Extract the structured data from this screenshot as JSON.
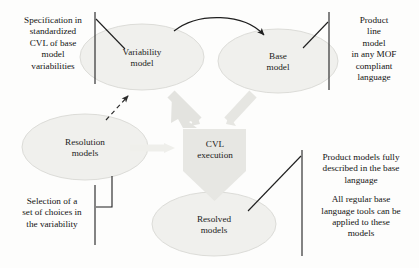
{
  "diagram": {
    "palette": {
      "ellipse_fill": "#f0f0ee",
      "ellipse_stroke": "#d8d8d4",
      "thick_arrow_fill": "#e2e2de",
      "box_fill": "#e6e6e2",
      "line_color": "#1f1f1f",
      "background": "#fdfdfc"
    },
    "nodes": [
      {
        "id": "variability-model",
        "shape": "ellipse",
        "line1": "Variability",
        "line2": "model"
      },
      {
        "id": "base-model",
        "shape": "ellipse",
        "line1": "Base",
        "line2": "model"
      },
      {
        "id": "resolution-models",
        "shape": "ellipse",
        "line1": "Resolution",
        "line2": "models"
      },
      {
        "id": "resolved-models",
        "shape": "ellipse",
        "line1": "Resolved",
        "line2": "models"
      },
      {
        "id": "cvl-execution",
        "shape": "down-arrow-pentagon",
        "line1": "CVL",
        "line2": "execution"
      }
    ],
    "annotations": {
      "spec": {
        "lines": [
          "Specification in",
          "standardized",
          "CVL of base",
          "model",
          "variabilities"
        ]
      },
      "product_line": {
        "lines": [
          "Product",
          "line",
          "model",
          "in any MOF",
          "compliant",
          "language"
        ]
      },
      "selection": {
        "lines": [
          "Selection of a",
          "set of choices in",
          "the variability"
        ]
      },
      "product_models": {
        "block1": [
          "Product models fully",
          "described in the base",
          "language"
        ],
        "block2": [
          "All regular base",
          "language tools can be",
          "applied to these",
          "models"
        ]
      }
    },
    "connectors": [
      {
        "id": "variability-to-base",
        "style": "solid-curved-arrow"
      },
      {
        "id": "resolution-to-variability",
        "style": "dashed-arrow"
      },
      {
        "id": "variability-to-cvl",
        "style": "thick-gray-arrow"
      },
      {
        "id": "base-to-cvl",
        "style": "thick-gray-arrow"
      },
      {
        "id": "resolution-to-cvl",
        "style": "thick-gray-arrow-faint"
      },
      {
        "id": "cvl-to-resolved",
        "style": "pentagon-tip"
      }
    ]
  }
}
